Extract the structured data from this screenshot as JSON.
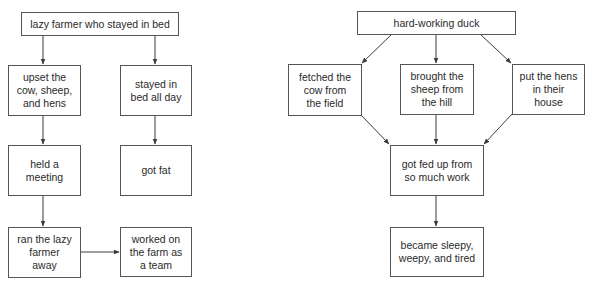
{
  "diagrams": [
    {
      "id": "lazy-farmer",
      "nodes": {
        "root": "lazy farmer who stayed in bed",
        "left1": "upset the\ncow, sheep,\nand hens",
        "left2": "held a\nmeeting",
        "left3": "ran the lazy\nfarmer\naway",
        "right1": "stayed in\nbed all day",
        "right2": "got fat",
        "right3": "worked on\nthe farm as\na team"
      },
      "edges": [
        [
          "root",
          "left1"
        ],
        [
          "root",
          "right1"
        ],
        [
          "left1",
          "left2"
        ],
        [
          "left2",
          "left3"
        ],
        [
          "right1",
          "right2"
        ],
        [
          "left3",
          "right3"
        ]
      ]
    },
    {
      "id": "hard-working-duck",
      "nodes": {
        "root": "hard-working duck",
        "a": "fetched the\ncow from\nthe field",
        "b": "brought the\nsheep from\nthe hill",
        "c": "put the hens\nin their\nhouse",
        "merge": "got fed up from\nso much work",
        "end": "became sleepy,\nweepy, and tired"
      },
      "edges": [
        [
          "root",
          "a"
        ],
        [
          "root",
          "b"
        ],
        [
          "root",
          "c"
        ],
        [
          "a",
          "merge"
        ],
        [
          "b",
          "merge"
        ],
        [
          "c",
          "merge"
        ],
        [
          "merge",
          "end"
        ]
      ]
    }
  ],
  "colors": {
    "line": "#3a3a3a",
    "border": "#555555",
    "text": "#2a2a2a",
    "background": "#ffffff"
  }
}
